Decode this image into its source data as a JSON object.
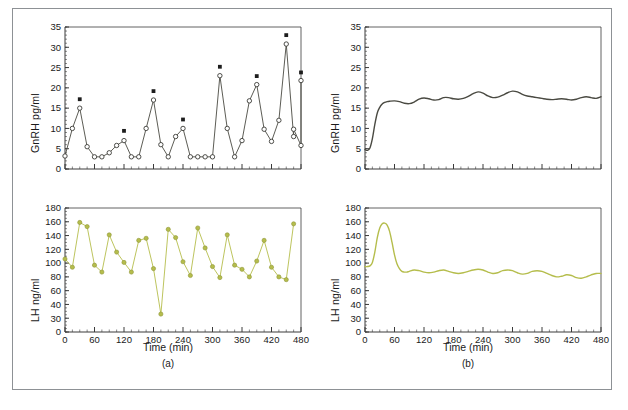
{
  "figure": {
    "panels": [
      {
        "id": "a",
        "letter_label": "(a)"
      },
      {
        "id": "b",
        "letter_label": "(b)"
      }
    ]
  },
  "axes": {
    "x_label": "Time (min)",
    "y_label_gnrh": "GnRH pg/ml",
    "y_label_lh": "LH ng/ml",
    "x_ticks": [
      "0",
      "60",
      "120",
      "180",
      "240",
      "300",
      "360",
      "420",
      "480"
    ],
    "y_ticks_gnrh": [
      "0",
      "5",
      "10",
      "15",
      "20",
      "25",
      "30",
      "35"
    ],
    "y_ticks_lh": [
      "0",
      "30",
      "40",
      "60",
      "80",
      "100",
      "120",
      "140",
      "160",
      "180"
    ]
  },
  "colors": {
    "gnrh_trace": "#4a4a42",
    "lh_trace": "#b5bd4c",
    "lh_marker": "#b5bd4c",
    "gnrh_marker_edge": "#3a3a35",
    "gnrh_marker_fill": "#ffffff",
    "significance_marker": "#1d1d1d",
    "axis": "#3a3a3a",
    "frame": "#8d9195",
    "background": "#ffffff"
  },
  "chart_data": [
    {
      "type": "line",
      "id": "gnrh-experimental",
      "panel": "a",
      "title": "",
      "xlabel": "Time (min)",
      "ylabel": "GnRH pg/ml",
      "xlim": [
        0,
        480
      ],
      "ylim": [
        0,
        35
      ],
      "grid": false,
      "legend": "none",
      "marker": "open-circle",
      "x": [
        0,
        15,
        30,
        45,
        60,
        75,
        90,
        105,
        120,
        135,
        150,
        165,
        180,
        195,
        210,
        225,
        240,
        255,
        270,
        285,
        300,
        315,
        330,
        345,
        360,
        375,
        390,
        405,
        420,
        435,
        450,
        465
      ],
      "values": [
        3.2,
        10.0,
        15.0,
        5.5,
        3.0,
        3.0,
        4.0,
        5.8,
        7.0,
        3.0,
        3.0,
        10.0,
        17.0,
        6.0,
        3.0,
        8.0,
        10.0,
        3.0,
        3.0,
        3.0,
        3.0,
        23.0,
        10.0,
        3.0,
        7.0,
        16.8,
        20.8,
        9.8,
        6.8,
        12.0,
        30.8,
        8.0
      ],
      "significance_markers": [
        {
          "x": 30,
          "y": 17.2
        },
        {
          "x": 120,
          "y": 9.4
        },
        {
          "x": 180,
          "y": 19.2
        },
        {
          "x": 240,
          "y": 12.2
        },
        {
          "x": 315,
          "y": 25.2
        },
        {
          "x": 390,
          "y": 22.9
        },
        {
          "x": 450,
          "y": 33.0
        },
        {
          "x": 480,
          "y": 23.8
        }
      ],
      "x_tail": [
        480
      ],
      "values_tail": [
        21.8
      ],
      "tail_intermediate": {
        "x": [
          465,
          480
        ],
        "values": [
          9.8,
          5.8
        ]
      }
    },
    {
      "type": "line",
      "id": "lh-experimental",
      "panel": "a",
      "title": "",
      "xlabel": "Time (min)",
      "ylabel": "LH ng/ml",
      "xlim": [
        0,
        480
      ],
      "ylim": [
        0,
        180
      ],
      "grid": false,
      "legend": "none",
      "marker": "filled-circle",
      "x": [
        0,
        15,
        30,
        45,
        60,
        75,
        90,
        105,
        120,
        135,
        150,
        165,
        180,
        195,
        210,
        225,
        240,
        255,
        270,
        285,
        300,
        315,
        330,
        345,
        360,
        375,
        390,
        405,
        420,
        435,
        450,
        465
      ],
      "values": [
        106,
        94,
        159,
        153,
        97,
        87,
        141,
        116,
        101,
        87,
        133,
        136,
        92,
        33,
        149,
        137,
        102,
        82,
        151,
        122,
        95,
        79,
        141,
        97,
        91,
        80,
        103,
        133,
        94,
        80,
        76,
        157
      ]
    },
    {
      "type": "line",
      "id": "gnrh-model",
      "panel": "b",
      "title": "",
      "xlabel": "Time (min)",
      "ylabel": "GnRH pg/ml",
      "xlim": [
        0,
        480
      ],
      "ylim": [
        0,
        35
      ],
      "grid": false,
      "legend": "none",
      "marker": "none",
      "x": [
        0,
        5,
        10,
        15,
        20,
        25,
        30,
        35,
        40,
        45,
        50,
        60,
        70,
        80,
        90,
        100,
        110,
        120,
        130,
        140,
        150,
        160,
        170,
        180,
        190,
        200,
        210,
        220,
        230,
        240,
        250,
        260,
        270,
        280,
        290,
        300,
        310,
        320,
        330,
        340,
        350,
        360,
        370,
        380,
        390,
        400,
        410,
        420,
        430,
        440,
        450,
        460,
        470,
        480
      ],
      "values": [
        4.8,
        4.6,
        5.2,
        7.5,
        11.0,
        13.8,
        15.2,
        16.0,
        16.4,
        16.6,
        16.7,
        16.8,
        16.6,
        16.2,
        16.1,
        16.5,
        17.2,
        17.5,
        17.3,
        17.0,
        17.1,
        17.6,
        17.6,
        17.3,
        17.2,
        17.4,
        17.9,
        18.6,
        19.0,
        18.7,
        18.0,
        17.6,
        17.7,
        18.2,
        18.8,
        19.2,
        19.0,
        18.4,
        18.0,
        17.8,
        17.6,
        17.4,
        17.2,
        17.1,
        17.2,
        17.3,
        17.2,
        17.0,
        17.2,
        17.6,
        17.8,
        17.6,
        17.4,
        17.8
      ]
    },
    {
      "type": "line",
      "id": "lh-model",
      "panel": "b",
      "title": "",
      "xlabel": "Time (min)",
      "ylabel": "LH ng/ml",
      "xlim": [
        0,
        480
      ],
      "ylim": [
        0,
        180
      ],
      "grid": false,
      "legend": "none",
      "marker": "none",
      "x": [
        0,
        5,
        10,
        15,
        20,
        25,
        30,
        35,
        40,
        45,
        50,
        55,
        60,
        65,
        70,
        75,
        80,
        85,
        90,
        100,
        110,
        120,
        130,
        140,
        150,
        160,
        170,
        180,
        190,
        200,
        210,
        220,
        230,
        240,
        250,
        260,
        270,
        280,
        290,
        300,
        310,
        320,
        330,
        340,
        350,
        360,
        370,
        380,
        390,
        400,
        410,
        420,
        430,
        440,
        450,
        460,
        470,
        480
      ],
      "values": [
        95,
        95,
        96,
        101,
        116,
        137,
        151,
        157,
        158,
        155,
        146,
        130,
        112,
        99,
        92,
        88,
        87,
        87,
        88,
        90,
        89,
        87,
        86,
        87,
        89,
        90,
        88,
        86,
        85,
        86,
        88,
        90,
        91,
        90,
        87,
        85,
        86,
        89,
        90,
        89,
        86,
        84,
        85,
        88,
        89,
        88,
        85,
        82,
        80,
        81,
        83,
        82,
        79,
        78,
        80,
        83,
        85,
        85
      ]
    }
  ]
}
